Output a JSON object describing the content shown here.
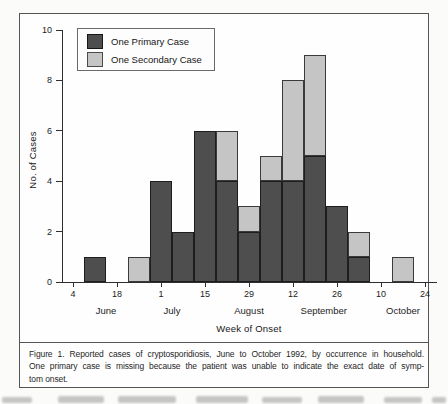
{
  "legend": {
    "items": [
      {
        "label": "One Primary Case",
        "color": "#4e4e4e"
      },
      {
        "label": "One Secondary Case",
        "color": "#c5c5c5"
      }
    ]
  },
  "caption": {
    "lines": [
      "Figure 1.  Reported cases of cryptosporidiosis, June to October 1992, by occurrence in household.",
      "One primary case is missing because the patient was unable to indicate the exact date of symp-",
      "tom onset."
    ]
  },
  "chart_data": {
    "type": "bar",
    "stacked": true,
    "title": "",
    "xlabel": "Week of Onset",
    "ylabel": "No. of Cases",
    "ylim": [
      0,
      10
    ],
    "y_ticks": [
      0,
      2,
      4,
      6,
      8,
      10
    ],
    "n_slots": 17,
    "x_tick_slots": [
      0,
      2,
      4,
      6,
      8,
      10,
      12,
      14,
      16
    ],
    "x_tick_labels": [
      "4",
      "18",
      "1",
      "15",
      "29",
      "12",
      "26",
      "10",
      "24"
    ],
    "months": [
      {
        "label": "June",
        "slot": 1.5
      },
      {
        "label": "July",
        "slot": 4.5
      },
      {
        "label": "August",
        "slot": 8.0
      },
      {
        "label": "September",
        "slot": 11.4
      },
      {
        "label": "October",
        "slot": 15.0
      }
    ],
    "series": [
      {
        "name": "One Primary Case",
        "color": "#4e4e4e",
        "values": [
          0,
          1,
          0,
          0,
          4,
          2,
          6,
          4,
          2,
          4,
          4,
          5,
          3,
          1,
          0,
          0,
          0
        ]
      },
      {
        "name": "One Secondary Case",
        "color": "#c5c5c5",
        "values": [
          0,
          0,
          0,
          1,
          0,
          0,
          0,
          2,
          1,
          1,
          4,
          4,
          0,
          1,
          0,
          1,
          0
        ]
      }
    ]
  }
}
